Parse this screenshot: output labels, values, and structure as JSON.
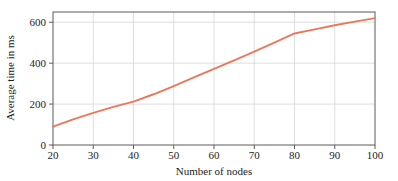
{
  "chart_data": {
    "type": "line",
    "title": "",
    "subtitle": "",
    "xlabel": "Number of nodes",
    "ylabel": "Average time in ms",
    "xlim": [
      20,
      100
    ],
    "ylim": [
      0,
      650
    ],
    "xticks": [
      20,
      30,
      40,
      50,
      60,
      70,
      80,
      90,
      100
    ],
    "yticks": [
      0,
      200,
      400,
      600
    ],
    "xtick_labels": [
      "20",
      "30",
      "40",
      "50",
      "60",
      "70",
      "80",
      "90",
      "100"
    ],
    "ytick_labels": [
      "0",
      "200",
      "400",
      "600"
    ],
    "grid": true,
    "grid_axis": "both",
    "legend": null,
    "legend_position": "none",
    "line_color": "#e8795a",
    "series": [
      {
        "name": "Average time",
        "color": "#e8795a",
        "x": [
          20,
          25,
          30,
          35,
          40,
          45,
          50,
          55,
          60,
          65,
          70,
          75,
          80,
          85,
          90,
          95,
          100
        ],
        "values": [
          90,
          125,
          157,
          186,
          212,
          248,
          288,
          330,
          372,
          414,
          456,
          500,
          545,
          565,
          585,
          603,
          620
        ]
      }
    ]
  },
  "axes": {
    "y_label": "Average time in ms",
    "x_label": "Number of nodes",
    "y_tick_0": "0",
    "y_tick_200": "200",
    "y_tick_400": "400",
    "y_tick_600": "600",
    "x_tick_20": "20",
    "x_tick_30": "30",
    "x_tick_40": "40",
    "x_tick_50": "50",
    "x_tick_60": "60",
    "x_tick_70": "70",
    "x_tick_80": "80",
    "x_tick_90": "90",
    "x_tick_100": "100"
  },
  "colors": {
    "series": "#e8795a",
    "frame": "#5b5b5b",
    "grid": "#d6d6d6",
    "text": "#1c1c1c",
    "background": "#ffffff"
  }
}
